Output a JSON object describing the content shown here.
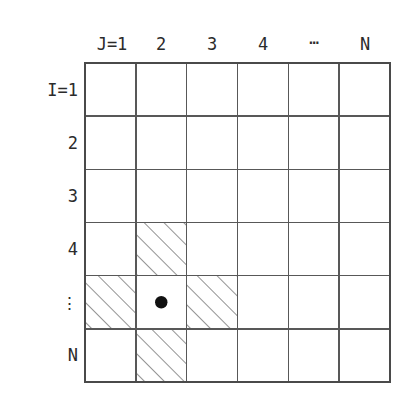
{
  "figure": {
    "background_color": "#ffffff",
    "line_color": "#585858",
    "text_color": "#2b2b2b",
    "dot_color": "#111111"
  },
  "axes": {
    "column_header_label": "J=1",
    "row_header_label": "I=1",
    "column_labels": [
      "J=1",
      "2",
      "3",
      "4",
      "⋯",
      "N"
    ],
    "row_labels": [
      "I=1",
      "2",
      "3",
      "4",
      "⋮",
      "N"
    ],
    "horizontal_ellipsis": "⋯",
    "vertical_ellipsis": "⋮"
  },
  "grid": {
    "columns": 6,
    "rows": 6,
    "left": 85,
    "top": 63,
    "right": 390,
    "bottom": 382,
    "cell_width": 50.83,
    "cell_height": 53.17,
    "column_x": [
      85,
      135.83,
      186.67,
      237.5,
      288.33,
      339.17,
      390
    ],
    "row_y": [
      63,
      116.17,
      169.33,
      222.5,
      275.67,
      328.83,
      382
    ]
  },
  "stencil": {
    "description": "five-point stencil",
    "center_cell": {
      "row": 5,
      "col": 2,
      "marker": "filled-dot",
      "marker_radius": 6
    },
    "hatched_cells": [
      {
        "row": 4,
        "col": 2
      },
      {
        "row": 5,
        "col": 1
      },
      {
        "row": 5,
        "col": 3
      },
      {
        "row": 6,
        "col": 2
      }
    ],
    "hatch_angle_degrees": 45,
    "hatch_direction": "lower-left to upper-right",
    "hatch_spacing": 14
  }
}
